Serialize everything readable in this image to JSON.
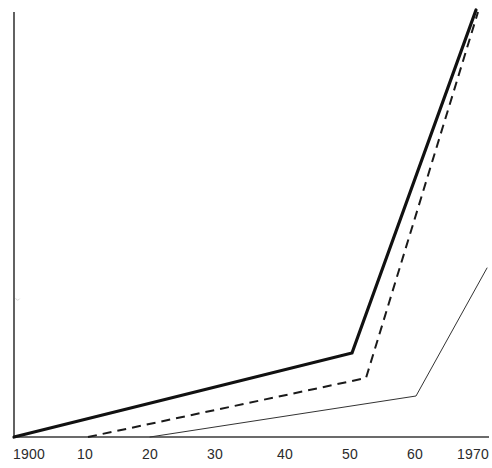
{
  "chart_data": {
    "type": "line",
    "title": "",
    "subtitle": "",
    "xlabel": "",
    "ylabel": "",
    "grid": false,
    "legend_position": "none",
    "annotations": [],
    "x_axis": {
      "tick_labels": [
        "1900",
        "10",
        "20",
        "30",
        "40",
        "50",
        "60",
        "1970"
      ],
      "tick_values": [
        1900,
        1910,
        1920,
        1930,
        1940,
        1950,
        1960,
        1970
      ],
      "tick_pixels": [
        29,
        85,
        150,
        215,
        285,
        350,
        415,
        473
      ],
      "range": [
        1900,
        1970
      ]
    },
    "y_axis": {
      "tick_labels": [],
      "range": [
        0,
        100
      ],
      "unlabeled": true
    },
    "series": [
      {
        "name": "bold-curve",
        "style": "solid-bold",
        "color": "#111111",
        "width": 3.2,
        "x": [
          1900,
          1950,
          1970
        ],
        "y": [
          0,
          19.2,
          98.5
        ],
        "points_px": [
          [
            14,
            437
          ],
          [
            352,
            353
          ],
          [
            476,
            10
          ]
        ]
      },
      {
        "name": "dashed-curve",
        "style": "dashed",
        "color": "#1a1a1a",
        "width": 2.0,
        "x": [
          1910,
          1952,
          1970
        ],
        "y": [
          0,
          13.5,
          98.0
        ],
        "points_px": [
          [
            88,
            437
          ],
          [
            366,
            378
          ],
          [
            478,
            12
          ]
        ]
      },
      {
        "name": "thin-curve",
        "style": "solid-thin",
        "color": "#333333",
        "width": 1.0,
        "x": [
          1920,
          1960,
          1970
        ],
        "y": [
          0,
          9.4,
          39.6
        ],
        "points_px": [
          [
            150,
            437
          ],
          [
            416,
            396
          ],
          [
            487,
            268
          ]
        ]
      }
    ],
    "axes_lines": {
      "y_axis_px": [
        [
          14,
          12
        ],
        [
          14,
          437
        ]
      ],
      "x_axis_px": [
        [
          14,
          437
        ],
        [
          489,
          437
        ]
      ],
      "color": "#3a3a3a"
    }
  },
  "marks": {
    "speck_note": "",
    "speck_px": [
      17,
      300
    ]
  }
}
